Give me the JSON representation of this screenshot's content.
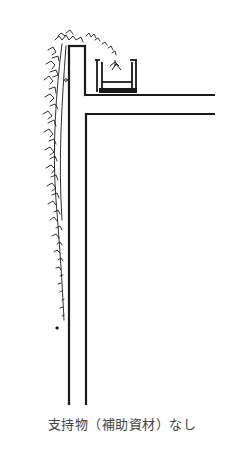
{
  "figure": {
    "line_color": "#1a1a1a",
    "elements": [
      "wall",
      "roof-slab",
      "planter-box",
      "plant",
      "trailing-ivy"
    ]
  },
  "caption": {
    "text": "支持物（補助資材）なし"
  }
}
